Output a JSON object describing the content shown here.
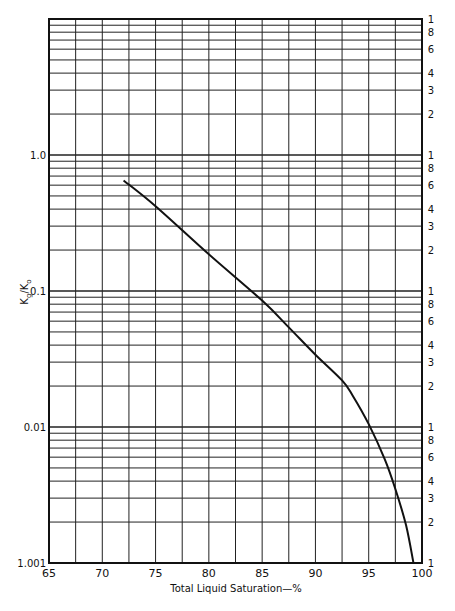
{
  "chart_data": {
    "type": "line",
    "title": "",
    "xlabel": "Total Liquid Saturation—%",
    "ylabel": "Kg/Ko",
    "ylabel_main": "K",
    "ylabel_sub1": "g",
    "ylabel_sep": "/K",
    "ylabel_sub2": "o",
    "xscale": "linear",
    "yscale": "log",
    "xlim": [
      65,
      100
    ],
    "ylim": [
      0.001,
      10
    ],
    "grid": true,
    "x_ticks": [
      65,
      70,
      75,
      80,
      85,
      90,
      95,
      100
    ],
    "x_tick_labels": [
      "65",
      "70",
      "75",
      "80",
      "85",
      "90",
      "95",
      "100"
    ],
    "x_minor_gridlines": [
      67.5,
      72.5,
      77.5,
      82.5,
      87.5,
      92.5,
      97.5
    ],
    "y_tick_labels_left": [
      {
        "value": 1.0,
        "label": "1.0"
      },
      {
        "value": 0.1,
        "label": "0.1"
      },
      {
        "value": 0.01,
        "label": "0.01"
      },
      {
        "value": 0.001,
        "label": "1.001"
      }
    ],
    "y_tick_labels_right": [
      "1",
      "8",
      "6",
      "4",
      "3",
      "2"
    ],
    "y_right_label_values": [
      1,
      8,
      6,
      4,
      3,
      2
    ],
    "series": [
      {
        "name": "Kg/Ko",
        "x": [
          72.0,
          75.0,
          80.0,
          85.0,
          87.5,
          90.0,
          92.5,
          93.5,
          95.0,
          96.5,
          97.5,
          98.5,
          99.2
        ],
        "y": [
          0.65,
          0.42,
          0.186,
          0.085,
          0.054,
          0.034,
          0.022,
          0.017,
          0.0105,
          0.0058,
          0.0035,
          0.0019,
          0.001
        ]
      }
    ]
  }
}
